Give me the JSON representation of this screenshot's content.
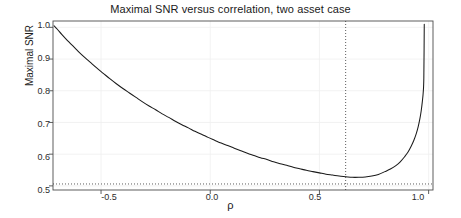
{
  "chart_data": {
    "type": "line",
    "title": "Maximal SNR versus correlation, two asset case",
    "xlabel": "ρ",
    "ylabel": "Maximal SNR",
    "xlim": [
      -0.72,
      1.02
    ],
    "ylim": [
      0.487,
      1.02
    ],
    "xticks": [
      -0.5,
      0.0,
      0.5,
      1.0
    ],
    "xticklabels": [
      "-0.5",
      "0.0",
      "0.5",
      "1.0"
    ],
    "yticks": [
      0.5,
      0.6,
      0.7,
      0.8,
      0.9,
      1.0
    ],
    "yticklabels": [
      "0.5",
      "0.6",
      "0.7",
      "0.8",
      "0.9",
      "1.0"
    ],
    "grid": true,
    "grid_color": "#efefef",
    "legend": null,
    "line_color": "#1a1a1a",
    "annotations": {
      "vline": {
        "x": 0.62,
        "style": "dotted",
        "color": "#333333"
      },
      "hline": {
        "y": 0.506,
        "style": "dotted",
        "color": "#333333"
      }
    },
    "series": [
      {
        "name": "Maximal SNR",
        "x": [
          -0.715,
          -0.7,
          -0.68,
          -0.66,
          -0.64,
          -0.62,
          -0.6,
          -0.575,
          -0.55,
          -0.52,
          -0.49,
          -0.46,
          -0.43,
          -0.4,
          -0.37,
          -0.34,
          -0.31,
          -0.28,
          -0.25,
          -0.22,
          -0.19,
          -0.16,
          -0.13,
          -0.1,
          -0.07,
          -0.04,
          -0.01,
          0.02,
          0.05,
          0.08,
          0.11,
          0.14,
          0.17,
          0.2,
          0.23,
          0.26,
          0.29,
          0.32,
          0.35,
          0.38,
          0.41,
          0.44,
          0.47,
          0.5,
          0.53,
          0.56,
          0.59,
          0.62,
          0.65,
          0.68,
          0.71,
          0.74,
          0.77,
          0.8,
          0.825,
          0.85,
          0.87,
          0.89,
          0.905,
          0.92,
          0.932,
          0.943,
          0.952,
          0.96,
          0.966,
          0.971,
          0.975,
          0.978,
          0.98
        ],
        "y": [
          1.005,
          0.994,
          0.978,
          0.963,
          0.949,
          0.935,
          0.921,
          0.905,
          0.89,
          0.872,
          0.855,
          0.838,
          0.822,
          0.807,
          0.793,
          0.779,
          0.765,
          0.752,
          0.74,
          0.727,
          0.716,
          0.704,
          0.693,
          0.683,
          0.672,
          0.663,
          0.653,
          0.644,
          0.635,
          0.627,
          0.619,
          0.611,
          0.603,
          0.596,
          0.589,
          0.583,
          0.576,
          0.57,
          0.565,
          0.559,
          0.554,
          0.549,
          0.545,
          0.541,
          0.537,
          0.534,
          0.531,
          0.529,
          0.527,
          0.527,
          0.528,
          0.531,
          0.536,
          0.545,
          0.553,
          0.564,
          0.576,
          0.592,
          0.606,
          0.625,
          0.643,
          0.664,
          0.686,
          0.712,
          0.737,
          0.765,
          0.793,
          0.84,
          1.01
        ]
      }
    ]
  },
  "axis": {
    "frame_color": "#4d4d4d"
  }
}
